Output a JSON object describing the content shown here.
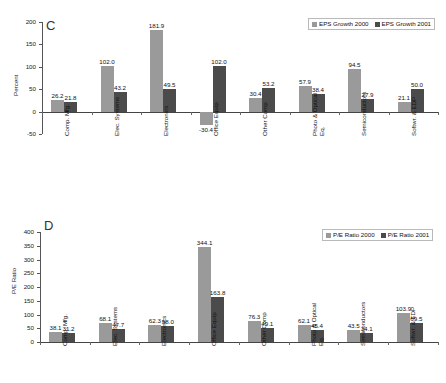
{
  "figure": {
    "panels": [
      {
        "letter": "C",
        "ylabel": "Percent",
        "legend": [
          "EPS Growth 2000",
          "EPS Growth 2001"
        ]
      },
      {
        "letter": "D",
        "ylabel": "P/E Ratio",
        "legend": [
          "P/E Ratio 2000",
          "P/E Ratio 2001"
        ]
      }
    ]
  },
  "chart_data": [
    {
      "type": "bar",
      "title": "C",
      "xlabel": "",
      "ylabel": "Percent",
      "ylim": [
        -50,
        200
      ],
      "yticks": [
        -50,
        0,
        50,
        100,
        150,
        200
      ],
      "grid": false,
      "legend_position": "top-right",
      "categories": [
        "Comp. Mfg.",
        "Elec. Systems",
        "Electronics",
        "Office Equip",
        "Other Comp",
        "Photo & Optical Eq.",
        "Semiconductors",
        "Softwr. & EDP"
      ],
      "series": [
        {
          "name": "EPS Growth 2000",
          "color": "#9a9a9a",
          "values": [
            26.2,
            102.0,
            181.9,
            -30.4,
            30.4,
            57.9,
            94.5,
            21.1
          ]
        },
        {
          "name": "EPS Growth 2001",
          "color": "#4b4b4b",
          "values": [
            21.8,
            43.2,
            49.5,
            102.0,
            53.2,
            38.4,
            27.9,
            50.0
          ]
        }
      ],
      "data_labels": [
        [
          "26.2",
          "102.0",
          "181.9",
          "-30.4",
          "30.4",
          "57.9",
          "94.5",
          "21.1"
        ],
        [
          "21.8",
          "43.2",
          "49.5",
          "102.0",
          "53.2",
          "38.4",
          "27.9",
          "50.0"
        ]
      ]
    },
    {
      "type": "bar",
      "title": "D",
      "xlabel": "",
      "ylabel": "P/E Ratio",
      "ylim": [
        0,
        400
      ],
      "yticks": [
        0,
        50,
        100,
        150,
        200,
        250,
        300,
        350,
        400
      ],
      "grid": false,
      "legend_position": "top-right",
      "categories": [
        "Comp. Mfg.",
        "Elec. Systems",
        "Electronics",
        "Office Equip",
        "Other Comp",
        "Photo & Optical Eq.",
        "Semiconductors",
        "Softwr. & EDP"
      ],
      "series": [
        {
          "name": "P/E Ratio 2000",
          "color": "#9a9a9a",
          "values": [
            38.1,
            68.1,
            62.3,
            344.1,
            76.3,
            62.1,
            43.5,
            103.9
          ]
        },
        {
          "name": "P/E Ratio 2001",
          "color": "#4b4b4b",
          "values": [
            31.2,
            47.7,
            58.0,
            163.8,
            49.1,
            45.4,
            34.1,
            69.5
          ]
        }
      ],
      "data_labels": [
        [
          "38.1",
          "68.1",
          "62.3",
          "344.1",
          "76.3",
          "62.1",
          "43.5",
          "103.9"
        ],
        [
          "31.2",
          "47.7",
          "58.0",
          "163.8",
          "49.1",
          "45.4",
          "34.1",
          "69.5"
        ]
      ]
    }
  ]
}
